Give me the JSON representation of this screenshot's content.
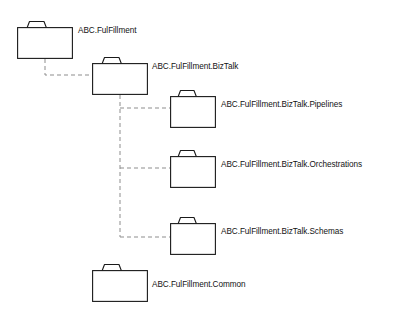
{
  "diagram": {
    "background_color": "#ffffff",
    "folder_stroke_color": "#1a1a1a",
    "folder_fill_color": "#ffffff",
    "connector_color": "#8d8d8d",
    "connector_style": "dashed",
    "label_color": "#131313",
    "nodes": [
      {
        "id": "root",
        "label": "ABC.FulFillment",
        "icon": "folder-icon",
        "x": 17,
        "y": 20,
        "width": 56,
        "height": 39,
        "label_x": 78,
        "label_y": 26
      },
      {
        "id": "biztalk",
        "label": "ABC.FulFillment.BizTalk",
        "icon": "folder-icon",
        "x": 92,
        "y": 56,
        "width": 56,
        "height": 39,
        "label_x": 152,
        "label_y": 62
      },
      {
        "id": "pipelines",
        "label": "ABC.FulFillment.BizTalk.Pipelines",
        "icon": "folder-icon",
        "x": 170,
        "y": 89,
        "width": 46,
        "height": 39,
        "label_x": 221,
        "label_y": 100
      },
      {
        "id": "orchestrations",
        "label": "ABC.FulFillment.BizTalk.Orchestrations",
        "icon": "folder-icon",
        "x": 170,
        "y": 149,
        "width": 46,
        "height": 39,
        "label_x": 221,
        "label_y": 160
      },
      {
        "id": "schemas",
        "label": "ABC.FulFillment.BizTalk.Schemas",
        "icon": "folder-icon",
        "x": 170,
        "y": 216,
        "width": 46,
        "height": 39,
        "label_x": 221,
        "label_y": 227
      },
      {
        "id": "common",
        "label": "ABC.FulFillment.Common",
        "icon": "folder-icon",
        "x": 92,
        "y": 263,
        "width": 56,
        "height": 39,
        "label_x": 152,
        "label_y": 280
      }
    ],
    "connectors": [
      {
        "id": "root-to-biztalk",
        "from": "root",
        "to": "biztalk"
      },
      {
        "id": "biztalk-to-pipelines",
        "from": "biztalk",
        "to": "pipelines"
      },
      {
        "id": "biztalk-to-orchestrations",
        "from": "biztalk",
        "to": "orchestrations"
      },
      {
        "id": "biztalk-to-schemas",
        "from": "biztalk",
        "to": "schemas"
      }
    ]
  }
}
